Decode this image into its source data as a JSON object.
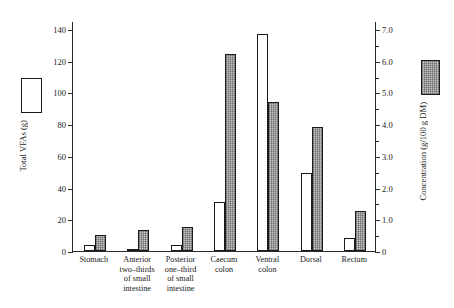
{
  "chart_data": {
    "type": "bar",
    "title": "",
    "subtitle": "",
    "xlabel": "",
    "ylabel": "Total VFAs (g)",
    "y2label": "Concentration (g/100 g DM)",
    "grid": false,
    "legend_position": "outside-left-and-right",
    "categories": [
      "Stomach",
      "Anterior\ntwo–thirds\nof small\nintestine",
      "Posterior\none–third\nof small\nintestine",
      "Caecum\ncolon",
      "Ventral\ncolon",
      "Dorsal",
      "Rectum"
    ],
    "series": [
      {
        "name": "Total VFAs (g)",
        "axis": "left",
        "style": "open",
        "values": [
          4,
          1,
          4,
          31,
          137,
          49,
          8
        ]
      },
      {
        "name": "Concentration (g/100 g DM)",
        "axis": "right",
        "style": "hatched",
        "values_left_scale": [
          10,
          13,
          15,
          124,
          94,
          78,
          25
        ],
        "values": [
          0.5,
          0.65,
          0.75,
          6.2,
          4.7,
          3.9,
          1.25
        ]
      }
    ],
    "ylim": [
      0,
      145
    ],
    "yticks": [
      0,
      20,
      40,
      60,
      80,
      100,
      120,
      140
    ],
    "ytick_labels": [
      "0",
      "20",
      "40",
      "60",
      "80",
      "100",
      "120",
      "140"
    ],
    "y2lim": [
      0,
      7.25
    ],
    "y2ticks": [
      0,
      0.5,
      1.0,
      1.5,
      2.0,
      2.5,
      3.0,
      3.5,
      4.0,
      4.5,
      5.0,
      5.5,
      6.0,
      6.5,
      7.0
    ],
    "y2tick_labels": [
      "0",
      "",
      "1.0",
      "",
      "2.0",
      "",
      "3.0",
      "",
      "4.0",
      "",
      "5.0",
      "",
      "6.0",
      "",
      "7.0"
    ]
  },
  "legend": {
    "left": {
      "label": "Total VFAs (g)",
      "swatch": "open-box"
    },
    "right": {
      "label": "Concentration (g/100 g DM)",
      "swatch": "hatched-box"
    }
  },
  "axes": {
    "left_label": "Total VFAs (g)",
    "right_label": "Concentration (g/100 g DM)"
  }
}
